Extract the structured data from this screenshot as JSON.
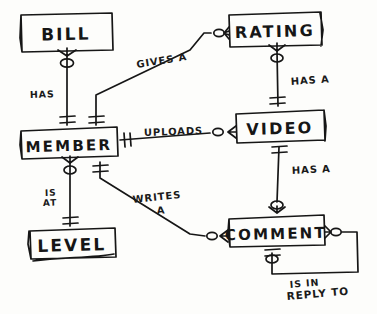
{
  "diagram": {
    "notation": "crow's foot",
    "ink_color": "#161616",
    "paper_color": "#fdfdfb",
    "entities": [
      {
        "id": "bill",
        "label": "BILL",
        "x": 20,
        "y": 13,
        "w": 93,
        "h": 39
      },
      {
        "id": "rating",
        "label": "RATING",
        "x": 228,
        "y": 12,
        "w": 94,
        "h": 35
      },
      {
        "id": "member",
        "label": "MEMBER",
        "x": 20,
        "y": 127,
        "w": 98,
        "h": 32
      },
      {
        "id": "video",
        "label": "VIDEO",
        "x": 235,
        "y": 110,
        "w": 90,
        "h": 33
      },
      {
        "id": "level",
        "label": "LEVEL",
        "x": 28,
        "y": 228,
        "w": 88,
        "h": 30
      },
      {
        "id": "comment",
        "label": "COMMENT",
        "x": 228,
        "y": 215,
        "w": 97,
        "h": 32
      }
    ],
    "relationships": [
      {
        "id": "has",
        "label": "HAS",
        "from": "member",
        "to": "bill",
        "from_card": "one",
        "to_card": "zero-or-many"
      },
      {
        "id": "gives-a",
        "label": "GIVES A",
        "from": "member",
        "to": "rating",
        "from_card": "one",
        "to_card": "zero-or-many"
      },
      {
        "id": "uploads",
        "label": "UPLOADS",
        "from": "member",
        "to": "video",
        "from_card": "one",
        "to_card": "zero-or-many"
      },
      {
        "id": "rating-has-a",
        "label": "HAS A",
        "from": "video",
        "to": "rating",
        "from_card": "one",
        "to_card": "zero-or-many"
      },
      {
        "id": "is-at",
        "label": "IS AT",
        "from": "member",
        "to": "level",
        "from_card": "one",
        "to_card": "zero-or-many"
      },
      {
        "id": "writes-a",
        "label": "WRITES A",
        "from": "member",
        "to": "comment",
        "from_card": "one",
        "to_card": "zero-or-many"
      },
      {
        "id": "video-has-a",
        "label": "HAS A",
        "from": "video",
        "to": "comment",
        "from_card": "one",
        "to_card": "zero-or-many"
      },
      {
        "id": "is-in-reply-to",
        "label": "IS IN REPLY TO",
        "from": "comment",
        "to": "comment",
        "from_card": "one",
        "to_card": "zero-or-many"
      }
    ],
    "relationship_label_lines": {
      "has": [
        "HAS"
      ],
      "gives_a": [
        "GIVES A"
      ],
      "uploads": [
        "UPLOADS"
      ],
      "rating_has_a": [
        "HAS A"
      ],
      "is_at": [
        "IS",
        "AT"
      ],
      "writes_a": [
        "WRITES",
        "A"
      ],
      "video_has_a": [
        "HAS A"
      ],
      "is_in_reply_to": [
        "IS IN",
        "REPLY TO"
      ]
    }
  }
}
